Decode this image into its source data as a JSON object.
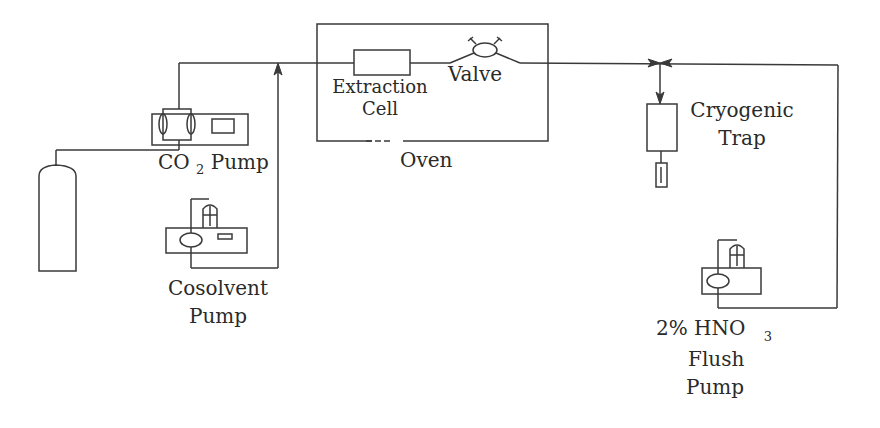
{
  "diagram": {
    "type": "process flow schematic (supercritical fluid extraction setup)",
    "colors": {
      "background": "#ffffff",
      "stroke": "#3a3a3a",
      "text": "#2a2a2a"
    },
    "components": {
      "co2_pump": {
        "label_main": "CO",
        "label_sub": "2",
        "label_tail": "Pump"
      },
      "cosolvent_pump": {
        "line1": "Cosolvent",
        "line2": "Pump"
      },
      "extraction_cell": {
        "line1": "Extraction",
        "line2": "Cell"
      },
      "valve": {
        "label": "Valve"
      },
      "oven": {
        "label": "Oven"
      },
      "cryogenic_trap": {
        "line1": "Cryogenic",
        "line2": "Trap"
      },
      "flush_pump": {
        "line1_main": "2% HNO",
        "line1_sub": "3",
        "line2": "Flush",
        "line3": "Pump"
      },
      "gas_cylinder": {
        "label": ""
      }
    }
  }
}
